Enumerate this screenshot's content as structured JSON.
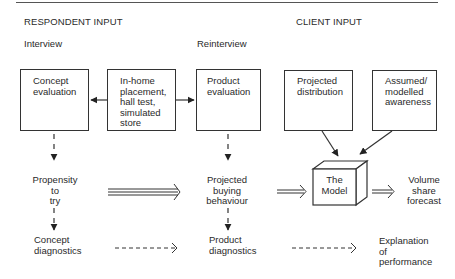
{
  "headings": {
    "respondent_input": "RESPONDENT INPUT",
    "client_input": "CLIENT INPUT",
    "interview": "Interview",
    "reinterview": "Reinterview"
  },
  "boxes": {
    "concept_evaluation": [
      "Concept",
      "evaluation"
    ],
    "test_setting": [
      "In-home",
      "placement,",
      "hall test,",
      "simulated",
      "store"
    ],
    "product_evaluation": [
      "Product",
      "evaluation"
    ],
    "projected_distribution": [
      "Projected",
      "distribution"
    ],
    "assumed_awareness": [
      "Assumed/",
      "modelled",
      "awareness"
    ],
    "model": [
      "The",
      "Model"
    ]
  },
  "outputs": {
    "propensity": [
      "Propensity",
      "to",
      "try"
    ],
    "concept_diagnostics": [
      "Concept",
      "diagnostics"
    ],
    "projected_buying": [
      "Projected",
      "buying",
      "behaviour"
    ],
    "product_diagnostics": [
      "Product",
      "diagnostics"
    ],
    "volume_share": [
      "Volume",
      "share",
      "forecast"
    ],
    "explanation": [
      "Explanation",
      "of",
      "performance"
    ]
  }
}
